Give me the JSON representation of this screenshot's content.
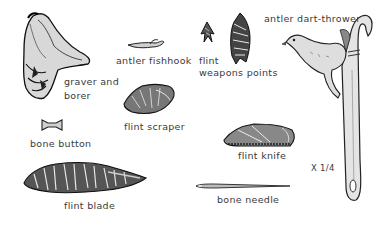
{
  "plate": {
    "labels": {
      "graver": [
        "graver and",
        "borer"
      ],
      "fishhook": "antler fishhook",
      "flint": "flint",
      "weapons_points": "weapons points",
      "dart_thrower": "antler dart-thrower",
      "bone_button": "bone button",
      "flint_scraper": "flint scraper",
      "flint_knife": "flint knife",
      "flint_blade": "flint blade",
      "bone_needle": "bone needle",
      "scale": "X 1/4"
    }
  }
}
